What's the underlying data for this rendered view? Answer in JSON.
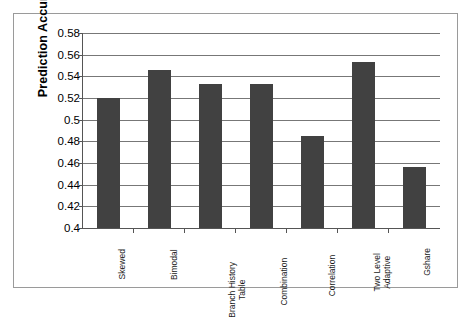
{
  "chart_data": {
    "type": "bar",
    "title": "",
    "subtitle": "",
    "xlabel": "",
    "ylabel": "Prediction Accuracy",
    "ylim": [
      0.4,
      0.58
    ],
    "ytick_step": 0.02,
    "grid": true,
    "legend": false,
    "legend_position": "none",
    "bar_color": "#414141",
    "axis_color": "#555555",
    "gridline_color": "#777777",
    "background_color": "#ffffff",
    "frame_color": "#9a9a9a",
    "yticks": [
      "0.58",
      "0.56",
      "0.54",
      "0.52",
      "0.5",
      "0.48",
      "0.46",
      "0.44",
      "0.42",
      "0.4"
    ],
    "ytick_values": [
      0.58,
      0.56,
      0.54,
      0.52,
      0.5,
      0.48,
      0.46,
      0.44,
      0.42,
      0.4
    ],
    "categories": [
      "Skewed",
      "Bimodal",
      "Branch History Table",
      "Combination",
      "Correlation",
      "Two Level Adaptive",
      "Gshare"
    ],
    "category_label_lines": [
      [
        "Skewed"
      ],
      [
        "Bimodal"
      ],
      [
        "Branch History",
        "Table"
      ],
      [
        "Combination"
      ],
      [
        "Correlation"
      ],
      [
        "Two Level",
        "Adaptive"
      ],
      [
        "Gshare"
      ]
    ],
    "values": [
      0.52,
      0.546,
      0.533,
      0.533,
      0.485,
      0.553,
      0.456
    ]
  }
}
